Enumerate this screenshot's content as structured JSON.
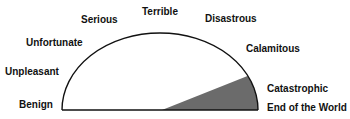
{
  "diagram": {
    "type": "semicircle-severity-scale",
    "colors": {
      "outline": "#111111",
      "wedge": "#6b6b6b",
      "background": "#ffffff",
      "text": "#111111"
    },
    "labels": [
      {
        "id": "benign",
        "text": "Benign"
      },
      {
        "id": "unpleasant",
        "text": "Unpleasant"
      },
      {
        "id": "unfortunate",
        "text": "Unfortunate"
      },
      {
        "id": "serious",
        "text": "Serious"
      },
      {
        "id": "terrible",
        "text": "Terrible"
      },
      {
        "id": "disastrous",
        "text": "Disastrous"
      },
      {
        "id": "calamitous",
        "text": "Calamitous"
      },
      {
        "id": "catastrophic",
        "text": "Catastrophic"
      },
      {
        "id": "end-of-the-world",
        "text": "End of the World"
      }
    ],
    "shaded_wedge": {
      "description": "Shaded sector from center of the baseline to the arc, spanning Catastrophic through End of the World",
      "from_label": "Catastrophic",
      "to_label": "End of the World"
    }
  }
}
